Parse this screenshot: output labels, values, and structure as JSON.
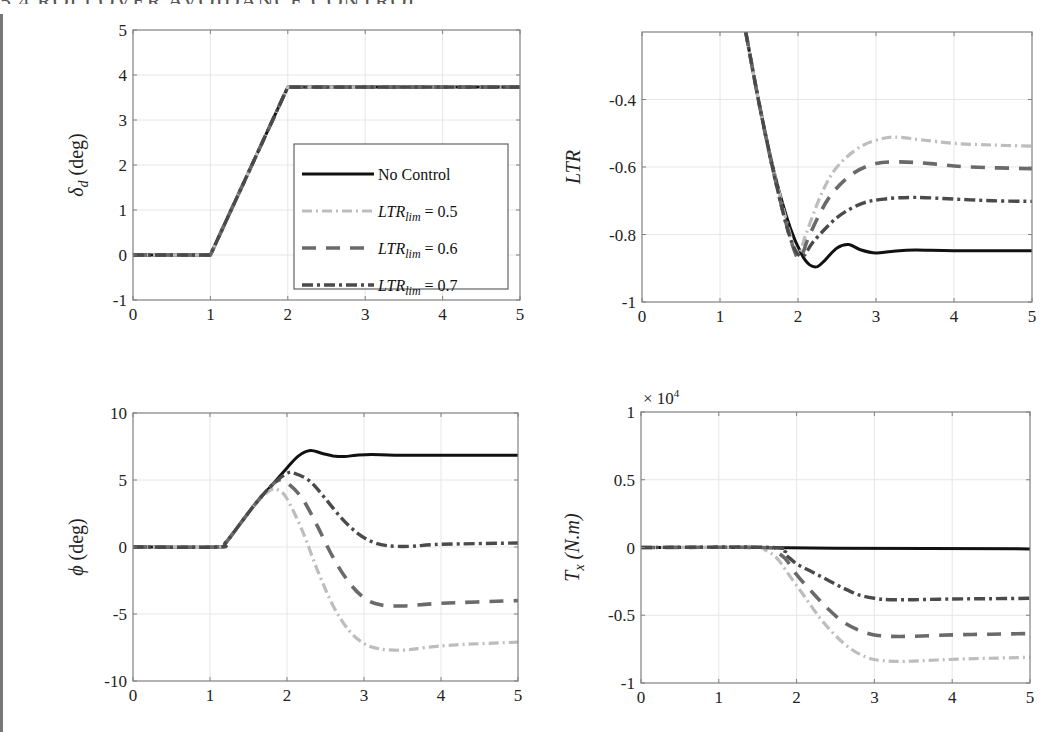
{
  "header": {
    "partial_heading": "5.4 ROLLOVER AVOIDANCE CONTROL"
  },
  "styles": {
    "no_control": {
      "color": "#111111",
      "dash": "",
      "width": 3
    },
    "ltr_0_5": {
      "color": "#bdbdbd",
      "dash": "10 4 2 4",
      "width": 3.2
    },
    "ltr_0_6": {
      "color": "#6a6a6a",
      "dash": "14 10",
      "width": 3.6
    },
    "ltr_0_7": {
      "color": "#4a4a4a",
      "dash": "11 4 3 4",
      "width": 3.4
    },
    "grid_color": "#e6e6e6",
    "axis_color": "#808080"
  },
  "legend": {
    "entries": [
      {
        "key": "no_control",
        "label": "No Control"
      },
      {
        "key": "ltr_0_5",
        "label_base": "LTR",
        "label_sub": "lim",
        "label_rest": " = 0.5"
      },
      {
        "key": "ltr_0_6",
        "label_base": "LTR",
        "label_sub": "lim",
        "label_rest": " = 0.6"
      },
      {
        "key": "ltr_0_7",
        "label_base": "LTR",
        "label_sub": "lim",
        "label_rest": " = 0.7"
      }
    ]
  },
  "chart_data": [
    {
      "type": "line",
      "title": "",
      "xlabel": "",
      "ylabel": "δ_d (deg)",
      "ylabel_base": "δ",
      "ylabel_sub": "d",
      "ylabel_rest": " (deg)",
      "xlim": [
        0,
        5
      ],
      "ylim": [
        -1,
        5
      ],
      "xticks": [
        0,
        1,
        2,
        3,
        4,
        5
      ],
      "yticks": [
        -1,
        0,
        1,
        2,
        3,
        4,
        5
      ],
      "grid": true,
      "legend_position": "inside-lower-right",
      "box": {
        "x0": 133,
        "y0": 30,
        "x1": 520,
        "y1": 300
      },
      "series": [
        {
          "name": "No Control",
          "key": "no_control",
          "x": [
            0,
            1,
            2,
            5
          ],
          "y": [
            0,
            0,
            3.73,
            3.73
          ]
        },
        {
          "name": "LTR_lim = 0.5",
          "key": "ltr_0_5",
          "x": [
            0,
            1,
            2,
            5
          ],
          "y": [
            0,
            0,
            3.73,
            3.73
          ]
        },
        {
          "name": "LTR_lim = 0.6",
          "key": "ltr_0_6",
          "x": [
            0,
            1,
            2,
            5
          ],
          "y": [
            0,
            0,
            3.73,
            3.73
          ]
        },
        {
          "name": "LTR_lim = 0.7",
          "key": "ltr_0_7",
          "x": [
            0,
            1,
            2,
            5
          ],
          "y": [
            0,
            0,
            3.73,
            3.73
          ]
        }
      ]
    },
    {
      "type": "line",
      "title": "",
      "xlabel": "",
      "ylabel": "LTR",
      "ylabel_italic": true,
      "xlim": [
        0,
        5
      ],
      "ylim": [
        -1,
        -0.2
      ],
      "xticks": [
        0,
        1,
        2,
        3,
        4,
        5
      ],
      "yticks": [
        -1,
        -0.8,
        -0.6,
        -0.4
      ],
      "ytick_labels": [
        "-1",
        "-0.8",
        "-0.6",
        "-0.4"
      ],
      "grid": true,
      "box": {
        "x0": 642,
        "y0": 32,
        "x1": 1032,
        "y1": 302
      },
      "series": [
        {
          "name": "No Control",
          "key": "no_control",
          "x": [
            1.33,
            1.5,
            1.7,
            1.9,
            2.05,
            2.15,
            2.25,
            2.35,
            2.5,
            2.65,
            2.8,
            3.0,
            3.2,
            3.5,
            4.0,
            5.0
          ],
          "y": [
            -0.2,
            -0.41,
            -0.62,
            -0.78,
            -0.86,
            -0.89,
            -0.895,
            -0.875,
            -0.84,
            -0.83,
            -0.845,
            -0.855,
            -0.85,
            -0.846,
            -0.848,
            -0.848
          ]
        },
        {
          "name": "LTR_lim = 0.5",
          "key": "ltr_0_5",
          "x": [
            1.33,
            1.5,
            1.7,
            1.9,
            2.0,
            2.1,
            2.3,
            2.5,
            2.8,
            3.1,
            3.3,
            3.6,
            4.0,
            4.5,
            5.0
          ],
          "y": [
            -0.2,
            -0.41,
            -0.62,
            -0.8,
            -0.86,
            -0.8,
            -0.68,
            -0.6,
            -0.54,
            -0.515,
            -0.512,
            -0.52,
            -0.53,
            -0.535,
            -0.538
          ]
        },
        {
          "name": "LTR_lim = 0.6",
          "key": "ltr_0_6",
          "x": [
            1.33,
            1.5,
            1.7,
            1.9,
            2.02,
            2.15,
            2.4,
            2.7,
            3.0,
            3.3,
            3.7,
            4.2,
            5.0
          ],
          "y": [
            -0.2,
            -0.41,
            -0.63,
            -0.81,
            -0.87,
            -0.8,
            -0.69,
            -0.62,
            -0.59,
            -0.585,
            -0.59,
            -0.6,
            -0.605
          ]
        },
        {
          "name": "LTR_lim = 0.7",
          "key": "ltr_0_7",
          "x": [
            1.33,
            1.5,
            1.7,
            1.9,
            2.05,
            2.2,
            2.5,
            2.8,
            3.1,
            3.5,
            4.0,
            4.5,
            5.0
          ],
          "y": [
            -0.2,
            -0.41,
            -0.63,
            -0.81,
            -0.865,
            -0.82,
            -0.75,
            -0.71,
            -0.695,
            -0.69,
            -0.695,
            -0.7,
            -0.702
          ]
        }
      ]
    },
    {
      "type": "line",
      "title": "",
      "xlabel": "",
      "ylabel": "φ (deg)",
      "ylabel_base": "ϕ",
      "ylabel_rest": " (deg)",
      "xlim": [
        0,
        5
      ],
      "ylim": [
        -10,
        10
      ],
      "xticks": [
        0,
        1,
        2,
        3,
        4,
        5
      ],
      "yticks": [
        -10,
        -5,
        0,
        5,
        10
      ],
      "grid": true,
      "box": {
        "x0": 133,
        "y0": 413,
        "x1": 518,
        "y1": 681
      },
      "series": [
        {
          "name": "No Control",
          "key": "no_control",
          "x": [
            0,
            1.1,
            1.2,
            1.4,
            1.6,
            1.8,
            2.0,
            2.15,
            2.3,
            2.45,
            2.6,
            2.75,
            2.9,
            3.1,
            3.4,
            4.0,
            5.0
          ],
          "y": [
            0,
            0,
            0.3,
            1.8,
            3.3,
            4.6,
            5.9,
            6.8,
            7.2,
            7.0,
            6.8,
            6.75,
            6.85,
            6.9,
            6.85,
            6.85,
            6.85
          ]
        },
        {
          "name": "LTR_lim = 0.5",
          "key": "ltr_0_5",
          "x": [
            0,
            1.1,
            1.2,
            1.4,
            1.6,
            1.8,
            1.9,
            2.0,
            2.2,
            2.4,
            2.6,
            2.8,
            3.0,
            3.2,
            3.5,
            3.8,
            4.2,
            5.0
          ],
          "y": [
            0,
            0,
            0.3,
            1.8,
            3.3,
            4.3,
            4.2,
            3.6,
            1.2,
            -1.8,
            -4.4,
            -6.2,
            -7.2,
            -7.6,
            -7.7,
            -7.5,
            -7.3,
            -7.1
          ]
        },
        {
          "name": "LTR_lim = 0.6",
          "key": "ltr_0_6",
          "x": [
            0,
            1.1,
            1.2,
            1.4,
            1.6,
            1.8,
            1.9,
            2.0,
            2.2,
            2.4,
            2.6,
            2.8,
            3.0,
            3.2,
            3.5,
            4.0,
            5.0
          ],
          "y": [
            0,
            0,
            0.3,
            1.8,
            3.3,
            4.6,
            5.0,
            4.8,
            3.6,
            1.5,
            -0.8,
            -2.6,
            -3.8,
            -4.3,
            -4.4,
            -4.2,
            -4.0
          ]
        },
        {
          "name": "LTR_lim = 0.7",
          "key": "ltr_0_7",
          "x": [
            0,
            1.1,
            1.2,
            1.4,
            1.6,
            1.8,
            2.0,
            2.1,
            2.3,
            2.5,
            2.7,
            2.9,
            3.1,
            3.3,
            3.6,
            4.0,
            5.0
          ],
          "y": [
            0,
            0,
            0.3,
            1.8,
            3.3,
            4.6,
            5.5,
            5.5,
            4.9,
            3.6,
            2.2,
            1.1,
            0.4,
            0.1,
            0.05,
            0.2,
            0.3
          ]
        }
      ]
    },
    {
      "type": "line",
      "title": "",
      "xlabel": "",
      "ylabel": "T_x (N.m)",
      "ylabel_base": "T",
      "ylabel_sub": "x",
      "ylabel_rest": " (N.m)",
      "y_multiplier": "× 10^4",
      "y_multiplier_base": "× 10",
      "y_multiplier_exp": "4",
      "xlim": [
        0,
        5
      ],
      "ylim": [
        -1,
        1
      ],
      "xticks": [
        0,
        1,
        2,
        3,
        4,
        5
      ],
      "yticks": [
        -1,
        -0.5,
        0,
        0.5,
        1
      ],
      "grid": true,
      "box": {
        "x0": 641,
        "y0": 412,
        "x1": 1030,
        "y1": 683
      },
      "series": [
        {
          "name": "No Control",
          "key": "no_control",
          "x": [
            0,
            1.5,
            2.5,
            5.0
          ],
          "y": [
            0,
            0,
            -0.005,
            -0.01
          ]
        },
        {
          "name": "LTR_lim = 0.5",
          "key": "ltr_0_5",
          "x": [
            0,
            1.45,
            1.6,
            1.75,
            1.9,
            2.1,
            2.3,
            2.5,
            2.7,
            2.9,
            3.1,
            3.4,
            3.8,
            4.3,
            5.0
          ],
          "y": [
            0,
            0,
            -0.02,
            -0.08,
            -0.2,
            -0.36,
            -0.52,
            -0.65,
            -0.75,
            -0.81,
            -0.835,
            -0.84,
            -0.83,
            -0.82,
            -0.81
          ]
        },
        {
          "name": "LTR_lim = 0.6",
          "key": "ltr_0_6",
          "x": [
            0,
            1.55,
            1.7,
            1.85,
            2.0,
            2.2,
            2.4,
            2.6,
            2.8,
            3.0,
            3.2,
            3.5,
            4.0,
            4.5,
            5.0
          ],
          "y": [
            0,
            0,
            -0.02,
            -0.08,
            -0.2,
            -0.33,
            -0.45,
            -0.55,
            -0.61,
            -0.645,
            -0.655,
            -0.655,
            -0.645,
            -0.64,
            -0.635
          ]
        },
        {
          "name": "LTR_lim = 0.7",
          "key": "ltr_0_7",
          "x": [
            0,
            1.7,
            1.85,
            2.0,
            2.2,
            2.4,
            2.6,
            2.8,
            3.0,
            3.2,
            3.5,
            4.0,
            4.5,
            5.0
          ],
          "y": [
            0,
            0,
            -0.05,
            -0.12,
            -0.18,
            -0.24,
            -0.3,
            -0.35,
            -0.375,
            -0.385,
            -0.385,
            -0.38,
            -0.378,
            -0.375
          ]
        }
      ]
    }
  ]
}
